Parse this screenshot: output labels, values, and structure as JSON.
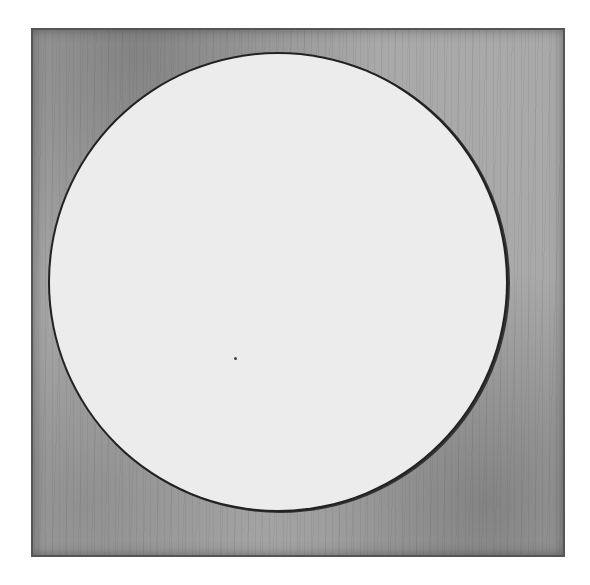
{
  "artwork": {
    "description": "Etched print: light circle inscribed in a dark, textured square plate",
    "colors": {
      "background": "#ffffff",
      "plate": "#a9a9a9",
      "circle_fill": "#ececec",
      "circle_outline": "#222222"
    }
  }
}
